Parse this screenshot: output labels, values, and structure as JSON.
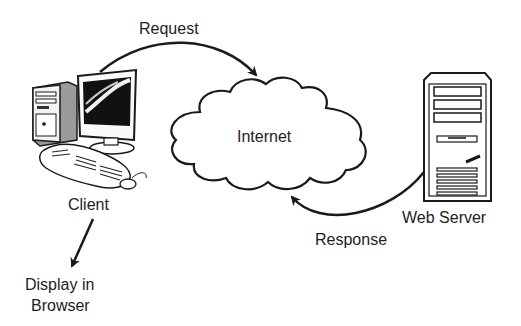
{
  "diagram": {
    "type": "client-server request/response flow",
    "nodes": {
      "client": {
        "label": "Client",
        "icon": "desktop-computer-icon"
      },
      "internet": {
        "label": "Internet",
        "icon": "cloud-icon"
      },
      "server": {
        "label": "Web Server",
        "icon": "server-tower-icon"
      },
      "browser": {
        "label_line1": "Display in",
        "label_line2": "Browser"
      }
    },
    "edges": {
      "request": {
        "label": "Request",
        "from": "Client",
        "to": "Internet"
      },
      "response": {
        "label": "Response",
        "from": "Web Server",
        "to": "Internet"
      },
      "display": {
        "from": "Client",
        "to": "Display in Browser"
      }
    },
    "colors": {
      "stroke": "#1a1a1a",
      "text": "#222222",
      "background": "#ffffff",
      "screen": "#111111",
      "tower_shade": "#9a9a9a"
    }
  }
}
